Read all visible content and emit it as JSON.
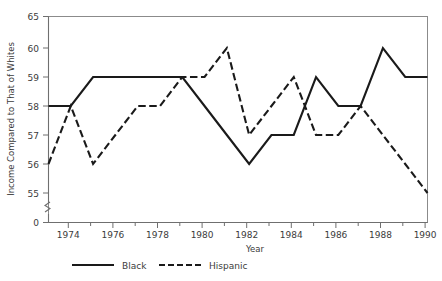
{
  "chart_data": {
    "type": "line",
    "title": "",
    "xlabel": "Year",
    "ylabel": "Income Compared to That of Whites",
    "x": [
      1973,
      1974,
      1975,
      1976,
      1977,
      1978,
      1979,
      1980,
      1981,
      1982,
      1983,
      1984,
      1985,
      1986,
      1987,
      1988,
      1989,
      1990
    ],
    "xlim": [
      1973,
      1990
    ],
    "ylim": [
      55,
      65
    ],
    "y_axis_broken": true,
    "y_break_below": 55,
    "y_ticks": [
      0,
      55,
      56,
      57,
      58,
      59,
      60,
      65
    ],
    "y_tick_labels": [
      "0",
      "55",
      "56",
      "57",
      "58",
      "59",
      "60",
      "65"
    ],
    "x_ticks": [
      1973,
      1974,
      1975,
      1976,
      1977,
      1978,
      1979,
      1980,
      1981,
      1982,
      1983,
      1984,
      1985,
      1986,
      1987,
      1988,
      1989,
      1990
    ],
    "x_tick_labels_shown": [
      "1974",
      "1976",
      "1978",
      "1980",
      "1982",
      "1984",
      "1986",
      "1988",
      "1990"
    ],
    "grid": false,
    "legend_position": "bottom",
    "series": [
      {
        "name": "Black",
        "style": "solid",
        "color": "#1a1a1a",
        "values": [
          58,
          58,
          59,
          59,
          59,
          59,
          59,
          58,
          57,
          56,
          57,
          57,
          59,
          58,
          58,
          60,
          59,
          59
        ]
      },
      {
        "name": "Hispanic",
        "style": "dashed",
        "color": "#1a1a1a",
        "values": [
          56,
          58,
          56,
          57,
          58,
          58,
          59,
          59,
          60,
          57,
          58,
          59,
          57,
          57,
          58,
          57,
          56,
          55
        ]
      }
    ]
  },
  "axes": {
    "y_title": "Income Compared to That of Whites",
    "x_title": "Year"
  },
  "legend": {
    "items": [
      {
        "label": "Black",
        "style": "solid"
      },
      {
        "label": "Hispanic",
        "style": "dashed"
      }
    ]
  },
  "ticks": {
    "y": [
      "65",
      "60",
      "59",
      "58",
      "57",
      "56",
      "55",
      "0"
    ],
    "x": [
      "1974",
      "1976",
      "1978",
      "1980",
      "1982",
      "1984",
      "1986",
      "1988",
      "1990"
    ]
  }
}
